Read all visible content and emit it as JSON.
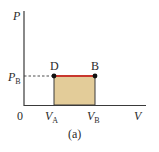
{
  "diagram": {
    "type": "pv-diagram",
    "caption": "(a)",
    "axes": {
      "y_label": "P",
      "x_label": "V",
      "origin_label": "0"
    },
    "ticks": {
      "pressure": {
        "main": "P",
        "sub": "B"
      },
      "volume_a": {
        "main": "V",
        "sub": "A"
      },
      "volume_b": {
        "main": "V",
        "sub": "B"
      }
    },
    "points": [
      {
        "label": "D",
        "x_tick": "VA",
        "y_tick": "PB"
      },
      {
        "label": "B",
        "x_tick": "VB",
        "y_tick": "PB"
      }
    ],
    "process": {
      "from": "D",
      "to": "B",
      "kind": "isobaric"
    },
    "colors": {
      "axis": "#3a3a3a",
      "process_line": "#c8372d",
      "work_area_fill": "#e3cc99",
      "point": "#111111"
    }
  }
}
